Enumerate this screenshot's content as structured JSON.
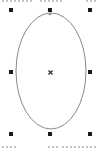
{
  "canvas": {
    "background": "#ffffff",
    "width": 101,
    "height": 148
  },
  "shape": {
    "type": "ellipse",
    "cx": 51,
    "cy": 71,
    "rx": 35,
    "ry": 58,
    "stroke": "#8a8a8a",
    "stroke_width": 1,
    "fill": "none",
    "selected": true
  },
  "selection": {
    "handle_color": "#1a1a1a",
    "handle_size": 4,
    "handles": [
      {
        "name": "top-left",
        "x": 9,
        "y": 8
      },
      {
        "name": "top-center",
        "x": 48,
        "y": 8
      },
      {
        "name": "top-right",
        "x": 88,
        "y": 8
      },
      {
        "name": "middle-left",
        "x": 9,
        "y": 70
      },
      {
        "name": "middle-right",
        "x": 88,
        "y": 70
      },
      {
        "name": "bottom-left",
        "x": 9,
        "y": 132
      },
      {
        "name": "bottom-center",
        "x": 48,
        "y": 132
      },
      {
        "name": "bottom-right",
        "x": 88,
        "y": 132
      }
    ],
    "center_marker": {
      "icon": "x-mark-icon",
      "x": 48,
      "y": 70,
      "color": "#2a2a2a"
    },
    "node_marker": {
      "x": 50,
      "y": 14,
      "color": "#909090"
    }
  },
  "clipped_text": {
    "top": "",
    "bottom_left": "",
    "bottom_right": ""
  }
}
